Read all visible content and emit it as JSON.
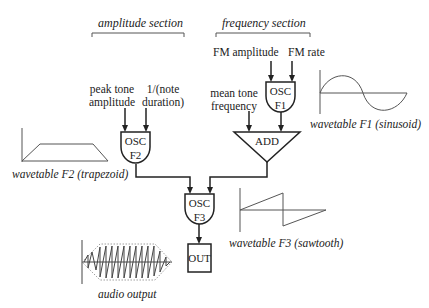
{
  "sections": {
    "amplitude": "amplitude section",
    "frequency": "frequency section"
  },
  "inputs": {
    "peak_tone_amplitude": [
      "peak tone",
      "amplitude"
    ],
    "note_duration": [
      "1/(note",
      "duration)"
    ],
    "fm_amplitude": "FM amplitude",
    "fm_rate": "FM rate",
    "mean_tone_frequency": [
      "mean tone",
      "frequency"
    ]
  },
  "blocks": {
    "osc_f1": [
      "OSC",
      "F1"
    ],
    "osc_f2": [
      "OSC",
      "F2"
    ],
    "osc_f3": [
      "OSC",
      "F3"
    ],
    "add": "ADD",
    "out": "OUT"
  },
  "wavetables": {
    "f1": "wavetable F1 (sinusoid)",
    "f2": "wavetable F2 (trapezoid)",
    "f3": "wavetable F3 (sawtooth)",
    "audio": "audio output"
  },
  "colors": {
    "stroke": "#222222",
    "wave": "#555555",
    "background": "#ffffff"
  }
}
